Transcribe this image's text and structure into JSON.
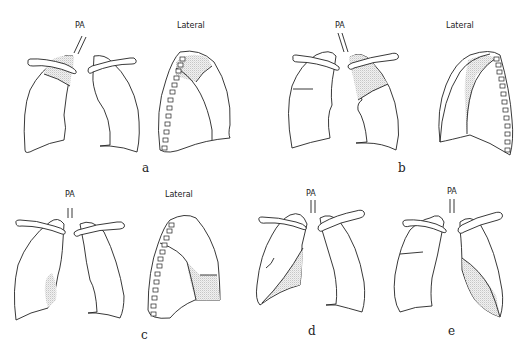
{
  "figure": {
    "panels": [
      {
        "id": "a",
        "label": "a",
        "views": [
          "PA",
          "Lateral"
        ]
      },
      {
        "id": "b",
        "label": "b",
        "views": [
          "PA",
          "Lateral"
        ]
      },
      {
        "id": "c",
        "label": "c",
        "views": [
          "PA",
          "Lateral"
        ]
      },
      {
        "id": "d",
        "label": "d",
        "views": [
          "PA"
        ]
      },
      {
        "id": "e",
        "label": "e",
        "views": [
          "PA"
        ]
      }
    ]
  },
  "labels": {
    "pa": "PA",
    "lateral": "Lateral",
    "a": "a",
    "b": "b",
    "c": "c",
    "d": "d",
    "e": "e"
  },
  "colors": {
    "line": "#222222",
    "stipple": "#888888",
    "background": "#ffffff"
  }
}
